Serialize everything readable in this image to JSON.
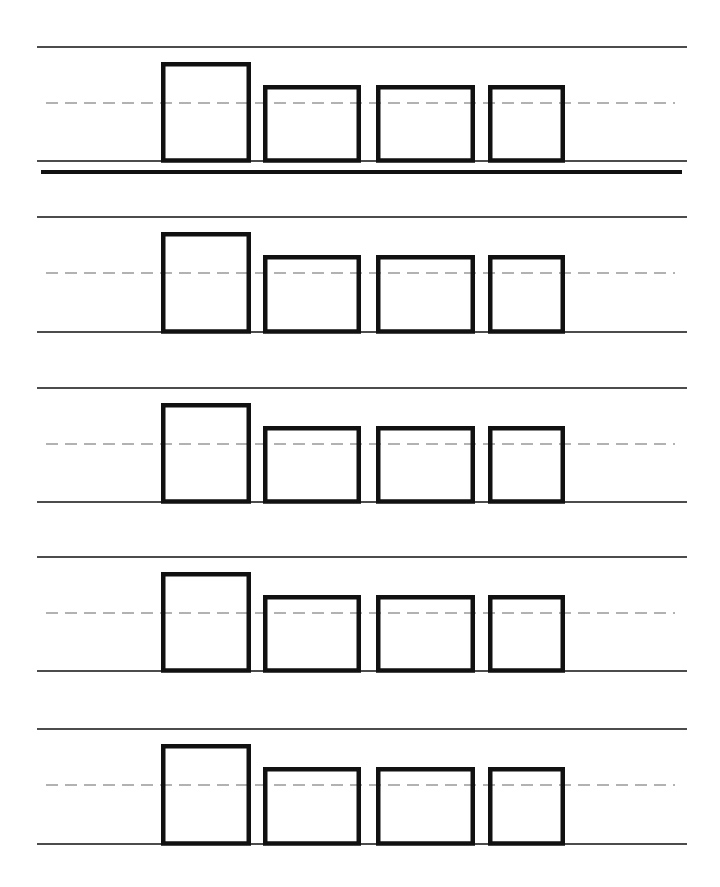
{
  "worksheet": {
    "type": "handwriting-practice-lines",
    "colors": {
      "line": "#111111",
      "dashed_midline": "#666666",
      "box_stroke": "#111111",
      "background": "#ffffff"
    },
    "line_extent": {
      "x1": 37,
      "x2": 687
    },
    "midline_extent": {
      "x1": 46,
      "x2": 675
    },
    "separator": {
      "x1": 41,
      "x2": 682,
      "y": 172,
      "thickness": 4
    },
    "letter_boxes": [
      {
        "name": "tall",
        "x1": 161,
        "x2": 251,
        "top_offset": -41
      },
      {
        "name": "short-1",
        "x1": 263,
        "x2": 361,
        "top_offset": -18
      },
      {
        "name": "short-2",
        "x1": 376,
        "x2": 475,
        "top_offset": -18
      },
      {
        "name": "short-3",
        "x1": 488,
        "x2": 565,
        "top_offset": -18
      }
    ],
    "rows": [
      {
        "index": 1,
        "top": 47,
        "mid": 103,
        "base": 161
      },
      {
        "index": 2,
        "top": 217,
        "mid": 273,
        "base": 332
      },
      {
        "index": 3,
        "top": 388,
        "mid": 444,
        "base": 502
      },
      {
        "index": 4,
        "top": 557,
        "mid": 613,
        "base": 671
      },
      {
        "index": 5,
        "top": 729,
        "mid": 785,
        "base": 844
      }
    ]
  }
}
